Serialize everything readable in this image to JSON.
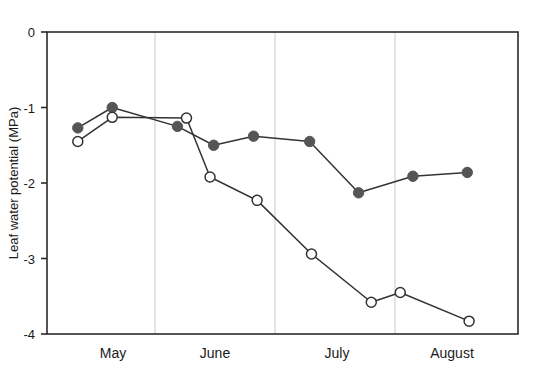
{
  "chart_data": {
    "type": "line",
    "title": "",
    "xlabel": "",
    "ylabel": "Leaf water potential (MPa)",
    "ylim": [
      -4,
      0
    ],
    "yticks": [
      0,
      -1,
      -2,
      -3,
      -4
    ],
    "ytick_labels": [
      "0",
      "-1",
      "-2",
      "-3",
      "-4"
    ],
    "xlim": [
      0,
      130
    ],
    "xtick_labels": [
      "May",
      "June",
      "July",
      "August"
    ],
    "grid": "vertical month separators",
    "legend": "none",
    "series": [
      {
        "name": "filled-circles",
        "marker": "filled-circle",
        "color": "#555555",
        "points": [
          {
            "x": 8.5,
            "y": -1.27
          },
          {
            "x": 18.0,
            "y": -1.0
          },
          {
            "x": 36.0,
            "y": -1.25
          },
          {
            "x": 46.0,
            "y": -1.5
          },
          {
            "x": 57.0,
            "y": -1.38
          },
          {
            "x": 72.5,
            "y": -1.45
          },
          {
            "x": 86.0,
            "y": -2.13
          },
          {
            "x": 101.0,
            "y": -1.91
          },
          {
            "x": 116.0,
            "y": -1.86
          }
        ]
      },
      {
        "name": "open-circles",
        "marker": "open-circle",
        "color": "#333333",
        "points": [
          {
            "x": 8.5,
            "y": -1.45
          },
          {
            "x": 18.0,
            "y": -1.13
          },
          {
            "x": 38.5,
            "y": -1.14
          },
          {
            "x": 45.0,
            "y": -1.92
          },
          {
            "x": 58.0,
            "y": -2.23
          },
          {
            "x": 73.0,
            "y": -2.94
          },
          {
            "x": 89.5,
            "y": -3.58
          },
          {
            "x": 97.5,
            "y": -3.45
          },
          {
            "x": 116.5,
            "y": -3.83
          }
        ]
      }
    ]
  },
  "axis": {
    "ylabel": "Leaf water potential (MPa)",
    "ytick_0": "0",
    "ytick_1": "-1",
    "ytick_2": "-2",
    "ytick_3": "-3",
    "ytick_4": "-4",
    "month_may": "May",
    "month_june": "June",
    "month_july": "July",
    "month_august": "August"
  },
  "colors": {
    "filled_marker": "#555555",
    "open_marker_stroke": "#333333",
    "open_marker_fill": "#ffffff",
    "line": "#333333",
    "frame": "#2b2b2b",
    "gridline": "#d9d9d9",
    "background": "#ffffff"
  }
}
